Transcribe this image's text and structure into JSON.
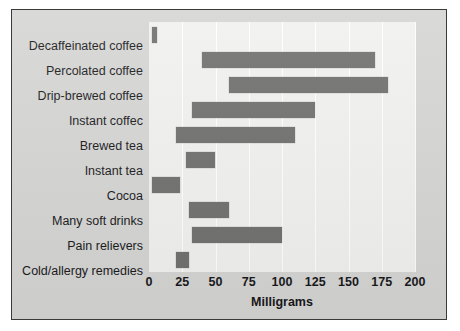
{
  "chart_data": {
    "type": "bar",
    "orientation": "horizontal",
    "bar_style": "range",
    "title": "",
    "xlabel": "Milligrams",
    "ylabel": "",
    "xlim": [
      0,
      200
    ],
    "xticks": [
      0,
      25,
      50,
      75,
      100,
      125,
      150,
      175,
      200
    ],
    "xtick_labels": [
      "0",
      "25",
      "50",
      "75",
      "100",
      "125",
      "150",
      "175",
      "200"
    ],
    "grid": true,
    "grid_axis": "x",
    "legend": false,
    "categories": [
      "Decaffeinated coffee",
      "Percolated coffee",
      "Drip-brewed coffee",
      "Instant coffec",
      "Brewed tea",
      "Instant tea",
      "Cocoa",
      "Many soft drinks",
      "Pain relievers",
      "Cold/allergy remedies"
    ],
    "ranges": [
      [
        2,
        6
      ],
      [
        40,
        170
      ],
      [
        60,
        180
      ],
      [
        32,
        125
      ],
      [
        20,
        110
      ],
      [
        28,
        50
      ],
      [
        2,
        23
      ],
      [
        30,
        60
      ],
      [
        32,
        100
      ],
      [
        20,
        30
      ]
    ],
    "series": [
      {
        "name": "Caffeine range (mg)",
        "start": [
          2,
          40,
          60,
          32,
          20,
          28,
          2,
          30,
          32,
          20
        ],
        "end": [
          6,
          170,
          180,
          125,
          110,
          50,
          23,
          60,
          100,
          30
        ]
      }
    ],
    "colors": {
      "bar": "#6f6f6d",
      "plot_background": "#f1f1ef",
      "figure_background": "#d5d5d3",
      "gridline": "#ffffff",
      "text": "#17171a",
      "border": "#3a3a38"
    }
  }
}
